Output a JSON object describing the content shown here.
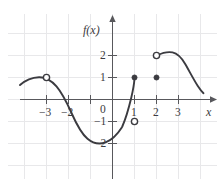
{
  "figure": {
    "background_color": "#ffffff",
    "grid_color": "#e8e8ea",
    "axis_color": "#58585c",
    "curve_color": "#3b3b40"
  },
  "axes": {
    "x_label": "x",
    "y_label": "f(x)",
    "x_ticks": [
      {
        "value": -3,
        "label": "−3"
      },
      {
        "value": -2,
        "label": "−2"
      },
      {
        "value": -1,
        "label": ""
      },
      {
        "value": 1,
        "label": "1"
      },
      {
        "value": 2,
        "label": "2"
      },
      {
        "value": 3,
        "label": "3"
      }
    ],
    "y_ticks": [
      {
        "value": 2,
        "label": "2"
      },
      {
        "value": 1,
        "label": "1"
      },
      {
        "value": -1,
        "label": "−1"
      },
      {
        "value": -2,
        "label": "−2"
      }
    ],
    "origin_label": "0"
  },
  "chart_data": {
    "type": "line",
    "xlabel": "x",
    "ylabel": "f(x)",
    "xlim": [
      -4.3,
      4.6
    ],
    "ylim": [
      -2.7,
      2.8
    ],
    "grid": true,
    "legend": "none",
    "x_ticks": [
      -3,
      -2,
      -1,
      1,
      2,
      3
    ],
    "y_ticks": [
      -2,
      -1,
      1,
      2
    ],
    "series": [
      {
        "name": "branch-left",
        "comment": "rises from x=-4.2 to local max at (-3,1) (open), falls to min near (-0.6,-1.85), rises to (1,-1) (open)",
        "points": [
          [
            -4.2,
            0.66
          ],
          [
            -4.0,
            0.78
          ],
          [
            -3.7,
            0.92
          ],
          [
            -3.4,
            0.99
          ],
          [
            -3.0,
            1.0
          ],
          [
            -2.7,
            0.93
          ],
          [
            -2.4,
            0.74
          ],
          [
            -2.1,
            0.38
          ],
          [
            -1.85,
            0.0
          ],
          [
            -1.6,
            -0.42
          ],
          [
            -1.3,
            -0.96
          ],
          [
            -1.0,
            -1.42
          ],
          [
            -0.75,
            -1.7
          ],
          [
            -0.5,
            -1.84
          ],
          [
            -0.25,
            -1.85
          ],
          [
            0.0,
            -1.78
          ],
          [
            0.25,
            -1.63
          ],
          [
            0.5,
            -1.45
          ],
          [
            0.75,
            -1.24
          ],
          [
            1.0,
            -1.0
          ]
        ]
      },
      {
        "name": "branch-middle",
        "comment": "rises from (1,-1) open endpoint up to (2,1) closed endpoint",
        "points": [
          [
            1.0,
            -1.0
          ],
          [
            1.15,
            -0.72
          ],
          [
            1.3,
            -0.42
          ],
          [
            1.45,
            -0.13
          ],
          [
            1.6,
            0.2
          ],
          [
            1.75,
            0.5
          ],
          [
            1.9,
            0.8
          ],
          [
            2.0,
            1.0
          ]
        ]
      },
      {
        "name": "branch-right",
        "comment": "arc from (2,2) open endpoint over max near (2.6,2.2) then falling to (4.3,0.65)",
        "points": [
          [
            2.0,
            2.0
          ],
          [
            2.2,
            2.12
          ],
          [
            2.45,
            2.2
          ],
          [
            2.7,
            2.18
          ],
          [
            3.0,
            2.02
          ],
          [
            3.3,
            1.74
          ],
          [
            3.6,
            1.4
          ],
          [
            3.9,
            1.05
          ],
          [
            4.2,
            0.7
          ],
          [
            4.35,
            0.52
          ]
        ]
      }
    ],
    "open_points": [
      {
        "x": -3,
        "y": 1,
        "label": "open circle at (-3, 1)"
      },
      {
        "x": 1,
        "y": -1,
        "label": "open circle at (1, -1)"
      },
      {
        "x": 2,
        "y": 2,
        "label": "open circle at (2, 2)"
      }
    ],
    "closed_points": [
      {
        "x": 1,
        "y": 1,
        "label": "filled dot at (1, 1)"
      },
      {
        "x": 2,
        "y": 1,
        "label": "filled dot at (2, 1)"
      }
    ]
  }
}
